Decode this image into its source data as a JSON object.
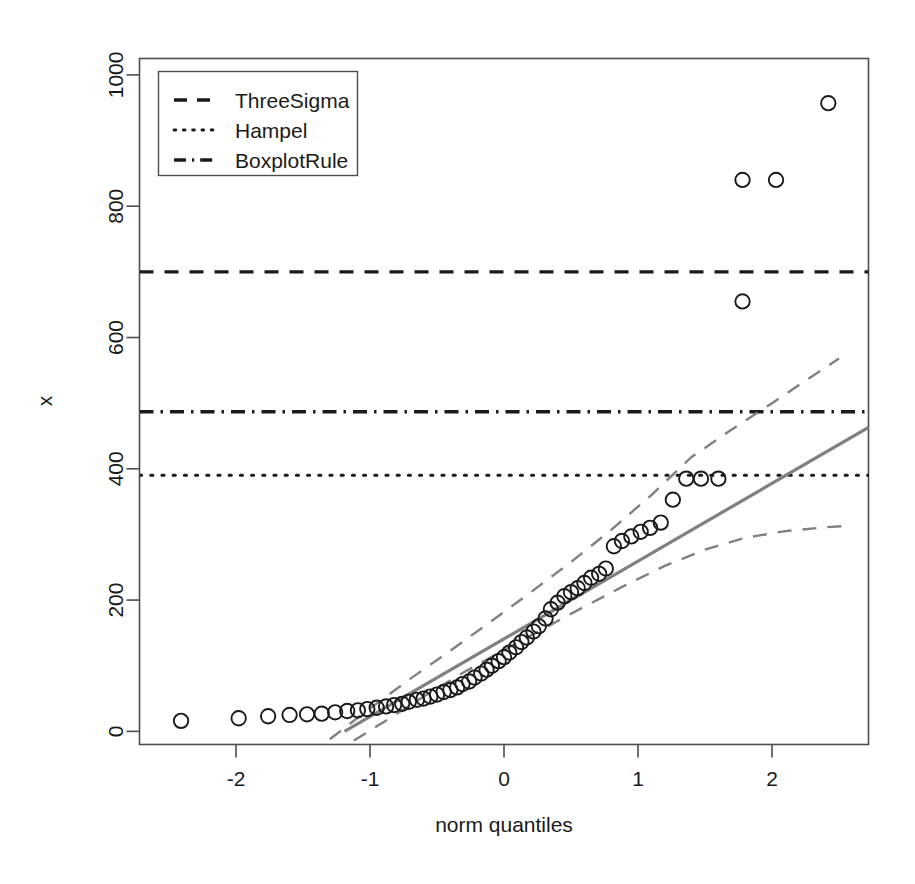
{
  "chart_data": {
    "type": "scatter",
    "title": "",
    "xlabel": "norm quantiles",
    "ylabel": "x",
    "xlim": [
      -2.72,
      2.72
    ],
    "ylim": [
      -20,
      1025
    ],
    "xticks": [
      -2,
      -1,
      0,
      1,
      2
    ],
    "xtick_labels": [
      "-2",
      "-1",
      "0",
      "1",
      "2"
    ],
    "yticks": [
      0,
      200,
      400,
      600,
      800,
      1000
    ],
    "ytick_labels": [
      "0",
      "200",
      "400",
      "600",
      "800",
      "1000"
    ],
    "grid": false,
    "box": true,
    "legend": {
      "position": "top-left",
      "entries": [
        {
          "label": "ThreeSigma",
          "dash": "dashed"
        },
        {
          "label": "Hampel",
          "dash": "dotted"
        },
        {
          "label": "BoxplotRule",
          "dash": "dashdot"
        }
      ]
    },
    "hlines": [
      {
        "name": "ThreeSigma",
        "value": 700,
        "dash": "dashed",
        "color": "#1a1a1a"
      },
      {
        "name": "BoxplotRule",
        "value": 487,
        "dash": "dashdot",
        "color": "#1a1a1a"
      },
      {
        "name": "Hampel",
        "value": 390,
        "dash": "dotted",
        "color": "#1a1a1a"
      }
    ],
    "qqline": {
      "name": "qq-reference-line",
      "color": "#808080",
      "x": [
        -1.19,
        2.72
      ],
      "y": [
        0,
        463
      ]
    },
    "confidence_band_upper": {
      "name": "upper-confidence-band",
      "color": "#808080",
      "dash": "dashed",
      "x": [
        -1.3,
        -1.0,
        -0.7,
        -0.4,
        -0.1,
        0.2,
        0.5,
        0.8,
        1.1,
        1.4,
        1.7,
        2.0,
        2.3,
        2.5
      ],
      "y": [
        -12,
        35,
        80,
        123,
        167,
        212,
        258,
        307,
        360,
        418,
        460,
        500,
        541,
        568
      ]
    },
    "confidence_band_lower": {
      "name": "lower-confidence-band",
      "color": "#808080",
      "dash": "dashed",
      "x": [
        -1.12,
        -0.9,
        -0.6,
        -0.3,
        0.0,
        0.3,
        0.6,
        0.9,
        1.2,
        1.5,
        1.8,
        2.1,
        2.4,
        2.55
      ],
      "y": [
        -14,
        14,
        53,
        90,
        124,
        157,
        190,
        222,
        252,
        277,
        295,
        305,
        311,
        313
      ]
    },
    "points": {
      "name": "sample-quantile-points",
      "marker": "open-circle",
      "color": "#1a1a1a",
      "x": [
        -2.41,
        -1.98,
        -1.76,
        -1.6,
        -1.47,
        -1.36,
        -1.26,
        -1.17,
        -1.09,
        -1.02,
        -0.95,
        -0.88,
        -0.82,
        -0.76,
        -0.71,
        -0.65,
        -0.6,
        -0.55,
        -0.5,
        -0.45,
        -0.4,
        -0.35,
        -0.31,
        -0.26,
        -0.22,
        -0.17,
        -0.13,
        -0.09,
        -0.04,
        0.0,
        0.04,
        0.09,
        0.13,
        0.17,
        0.22,
        0.26,
        0.31,
        0.35,
        0.4,
        0.45,
        0.5,
        0.55,
        0.6,
        0.65,
        0.71,
        0.76,
        0.82,
        0.88,
        0.95,
        1.02,
        1.09,
        1.17,
        1.26,
        1.36,
        1.47,
        1.6,
        1.78,
        1.78,
        2.03,
        2.42
      ],
      "y": [
        16,
        20,
        23,
        25,
        26,
        27,
        29,
        31,
        32,
        34,
        36,
        38,
        40,
        42,
        45,
        48,
        50,
        53,
        56,
        60,
        63,
        67,
        72,
        76,
        82,
        88,
        94,
        100,
        107,
        113,
        120,
        128,
        136,
        143,
        152,
        160,
        172,
        186,
        196,
        206,
        212,
        218,
        226,
        234,
        240,
        248,
        282,
        290,
        297,
        304,
        310,
        318,
        353,
        385,
        385,
        385,
        655,
        840,
        840,
        957
      ]
    }
  },
  "annotations": {
    "y_axis_title": "x",
    "x_axis_title": "norm quantiles"
  }
}
